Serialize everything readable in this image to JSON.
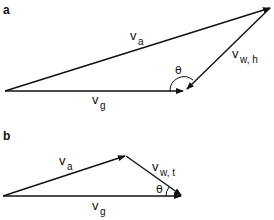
{
  "figure": {
    "panels": [
      {
        "id": "a",
        "label": "a",
        "vectors": {
          "air": {
            "symbol": "v",
            "subscript": "a"
          },
          "ground": {
            "symbol": "v",
            "subscript": "g"
          },
          "wind": {
            "symbol": "v",
            "subscript": "w, h"
          }
        },
        "angle_label": "θ"
      },
      {
        "id": "b",
        "label": "b",
        "vectors": {
          "air": {
            "symbol": "v",
            "subscript": "a"
          },
          "ground": {
            "symbol": "v",
            "subscript": "g"
          },
          "wind": {
            "symbol": "v",
            "subscript": "w, t"
          }
        },
        "angle_label": "θ"
      }
    ],
    "colors": {
      "stroke": "#111111",
      "background": "#ffffff"
    }
  }
}
